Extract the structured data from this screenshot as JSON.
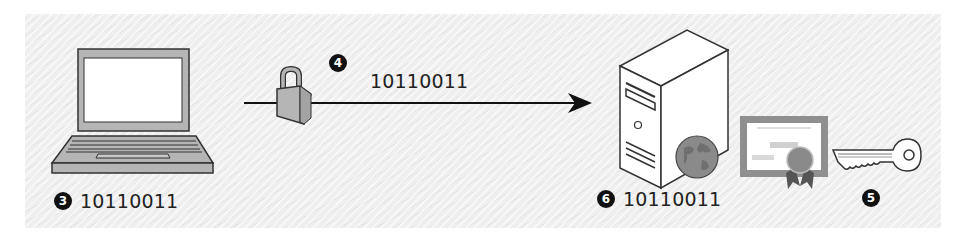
{
  "diagram": {
    "title": "",
    "colors": {
      "background": "#efefef",
      "stroke": "#333333",
      "device_fill": "#b5b5b5",
      "screen_fill": "#ffffff",
      "globe_fill": "#8a8a8a",
      "certificate_frame": "#8f8f8f",
      "badge_fill": "#111111"
    },
    "nodes": [
      {
        "id": "laptop",
        "icon": "laptop-icon",
        "step": "3",
        "data": "10110011"
      },
      {
        "id": "transmission",
        "icon": "padlock-icon",
        "step": "4",
        "data": "10110011",
        "connector": "arrow-right"
      },
      {
        "id": "server",
        "icon": "web-server-icon",
        "step": "6",
        "data": "10110011"
      },
      {
        "id": "certificate",
        "icon": "certificate-icon"
      },
      {
        "id": "key",
        "icon": "key-icon",
        "step": "5"
      }
    ]
  }
}
